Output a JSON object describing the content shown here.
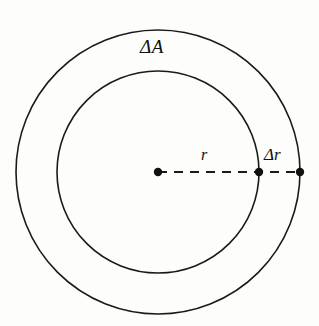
{
  "figure": {
    "type": "geometry-diagram",
    "background_color": "#fdfdfc",
    "stroke_color": "#1a1a1a",
    "canvas": {
      "width": 319,
      "height": 326
    },
    "center": {
      "x": 158,
      "y": 172
    },
    "circles": [
      {
        "name": "outer-circle",
        "radius": 142,
        "stroke_width": 1.6
      },
      {
        "name": "inner-circle",
        "radius": 101,
        "stroke_width": 1.6
      }
    ],
    "radius_line": {
      "name": "radius-dashed-line",
      "from": {
        "x": 158,
        "y": 172
      },
      "to": {
        "x": 300,
        "y": 172
      },
      "dash_pattern": "9 7",
      "stroke_width": 1.8
    },
    "points": [
      {
        "name": "center-point",
        "x": 158,
        "y": 172,
        "radius": 4.2
      },
      {
        "name": "inner-circle-point",
        "x": 259,
        "y": 172,
        "radius": 4.2
      },
      {
        "name": "outer-circle-point",
        "x": 300,
        "y": 172,
        "radius": 4.2
      }
    ],
    "labels": {
      "delta_area": "ΔA",
      "radius": "r",
      "delta_radius": "Δr"
    }
  }
}
